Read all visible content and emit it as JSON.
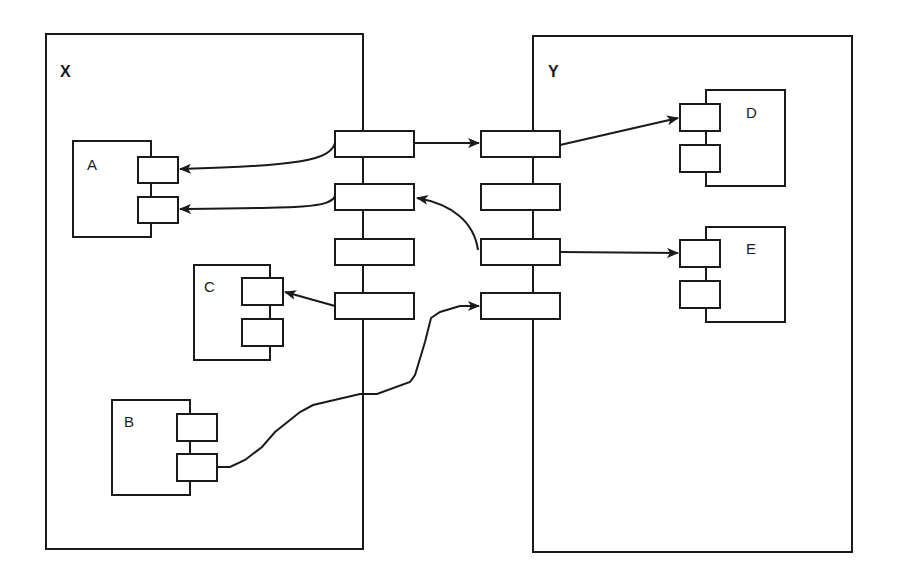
{
  "diagram": {
    "type": "component-connector",
    "stroke_color": "#1a1a1a",
    "background": "#ffffff",
    "containers": [
      {
        "id": "X",
        "label": "X"
      },
      {
        "id": "Y",
        "label": "Y"
      }
    ],
    "components": [
      {
        "id": "A",
        "label": "A",
        "container": "X",
        "ports": 2
      },
      {
        "id": "B",
        "label": "B",
        "container": "X",
        "ports": 2
      },
      {
        "id": "C",
        "label": "C",
        "container": "X",
        "ports": 2
      },
      {
        "id": "D",
        "label": "D",
        "container": "Y",
        "ports": 2
      },
      {
        "id": "E",
        "label": "E",
        "container": "Y",
        "ports": 2
      }
    ],
    "boundary_ports": {
      "X": [
        "x-port-1",
        "x-port-2",
        "x-port-3",
        "x-port-4"
      ],
      "Y": [
        "y-port-1",
        "y-port-2",
        "y-port-3",
        "y-port-4"
      ]
    },
    "connections": [
      {
        "from": "X.x-port-1",
        "to": "A.port-1",
        "style": "curved-arrow"
      },
      {
        "from": "X.x-port-2",
        "to": "A.port-2",
        "style": "curved-arrow"
      },
      {
        "from": "X.x-port-1",
        "to": "Y.y-port-1",
        "style": "straight-arrow"
      },
      {
        "from": "Y.y-port-1",
        "to": "D.port-1",
        "style": "straight-arrow"
      },
      {
        "from": "Y.y-port-3",
        "to": "X.x-port-2",
        "style": "curved-arrow"
      },
      {
        "from": "Y.y-port-3",
        "to": "E.port-1",
        "style": "straight-arrow"
      },
      {
        "from": "X.x-port-4",
        "to": "C.port-1",
        "style": "straight-arrow"
      },
      {
        "from": "B.port-2",
        "to": "Y.y-port-4",
        "style": "freeform-arrow"
      }
    ]
  }
}
